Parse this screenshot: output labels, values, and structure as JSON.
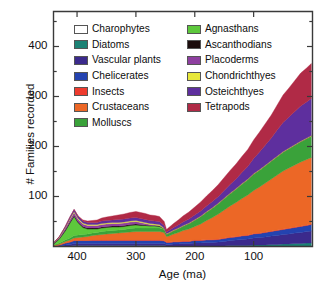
{
  "chart_data": {
    "type": "area",
    "title": "",
    "xlabel": "Age (ma)",
    "ylabel": "# Families recorded",
    "xlim": [
      440,
      0
    ],
    "ylim": [
      0,
      470
    ],
    "x_reversed": true,
    "grid": false,
    "legend_position": "upper-left-inside",
    "xticks": [
      400,
      300,
      200,
      100
    ],
    "xtick_labels": [
      "400",
      "300",
      "200",
      "100"
    ],
    "yticks": [
      100,
      200,
      300,
      400
    ],
    "ytick_labels": [
      "100",
      "200",
      "300",
      "400"
    ],
    "y_minor_ticks": [
      50,
      150,
      250,
      350,
      450
    ],
    "stacked": true,
    "x": [
      440,
      430,
      420,
      412,
      405,
      398,
      390,
      382,
      374,
      366,
      358,
      350,
      340,
      330,
      320,
      310,
      300,
      292,
      284,
      276,
      268,
      260,
      252,
      248,
      244,
      236,
      228,
      220,
      210,
      200,
      190,
      180,
      170,
      160,
      150,
      140,
      130,
      120,
      110,
      100,
      90,
      80,
      70,
      60,
      50,
      40,
      30,
      20,
      10,
      2
    ],
    "series": [
      {
        "name": "Charophytes",
        "color": "#ffffff",
        "values": [
          0,
          0,
          1,
          1,
          2,
          2,
          2,
          2,
          2,
          2,
          2,
          2,
          2,
          2,
          2,
          2,
          2,
          2,
          2,
          2,
          2,
          2,
          2,
          1,
          1,
          1,
          1,
          1,
          1,
          1,
          1,
          1,
          1,
          1,
          1,
          1,
          1,
          1,
          1,
          1,
          1,
          1,
          1,
          1,
          1,
          1,
          1,
          1,
          1,
          1
        ]
      },
      {
        "name": "Diatoms",
        "color": "#1c8275",
        "values": [
          0,
          0,
          0,
          0,
          0,
          0,
          0,
          0,
          0,
          0,
          0,
          0,
          0,
          0,
          0,
          0,
          0,
          0,
          0,
          0,
          0,
          0,
          0,
          0,
          0,
          0,
          0,
          0,
          0,
          0,
          0,
          0,
          0,
          0,
          0,
          1,
          1,
          1,
          1,
          2,
          2,
          2,
          3,
          3,
          4,
          4,
          5,
          5,
          6,
          6
        ]
      },
      {
        "name": "Vascular plants",
        "color": "#3b2a8c",
        "values": [
          0,
          1,
          2,
          3,
          4,
          4,
          4,
          4,
          4,
          4,
          4,
          4,
          4,
          4,
          4,
          4,
          4,
          4,
          4,
          4,
          4,
          4,
          4,
          3,
          3,
          4,
          4,
          5,
          5,
          6,
          6,
          7,
          7,
          8,
          9,
          10,
          11,
          12,
          13,
          14,
          15,
          16,
          17,
          18,
          19,
          20,
          21,
          22,
          23,
          24
        ]
      },
      {
        "name": "Chelicerates",
        "color": "#2443b0",
        "values": [
          1,
          2,
          4,
          5,
          6,
          6,
          6,
          6,
          6,
          6,
          6,
          6,
          6,
          6,
          6,
          6,
          6,
          6,
          6,
          6,
          6,
          6,
          5,
          4,
          4,
          4,
          4,
          4,
          4,
          5,
          5,
          5,
          5,
          5,
          6,
          6,
          6,
          7,
          7,
          8,
          8,
          9,
          9,
          10,
          10,
          11,
          11,
          12,
          12,
          13
        ]
      },
      {
        "name": "Insects",
        "color": "#ee3b2e",
        "values": [
          0,
          0,
          0,
          0,
          0,
          0,
          0,
          0,
          1,
          1,
          1,
          1,
          1,
          1,
          1,
          1,
          1,
          1,
          1,
          1,
          1,
          1,
          1,
          1,
          1,
          1,
          1,
          1,
          1,
          1,
          1,
          1,
          1,
          1,
          1,
          1,
          1,
          1,
          1,
          1,
          1,
          1,
          1,
          1,
          1,
          1,
          1,
          1,
          1,
          1
        ]
      },
      {
        "name": "Crustaceans",
        "color": "#ec6726",
        "values": [
          1,
          2,
          3,
          4,
          5,
          6,
          7,
          8,
          9,
          10,
          11,
          12,
          13,
          14,
          15,
          16,
          17,
          17,
          17,
          17,
          17,
          17,
          16,
          11,
          12,
          15,
          18,
          21,
          24,
          27,
          32,
          38,
          44,
          50,
          56,
          62,
          68,
          74,
          80,
          86,
          92,
          98,
          104,
          110,
          116,
          120,
          124,
          128,
          131,
          133
        ]
      },
      {
        "name": "Molluscs",
        "color": "#3aa23a",
        "values": [
          1,
          2,
          3,
          4,
          5,
          5,
          5,
          5,
          5,
          5,
          6,
          6,
          6,
          6,
          6,
          7,
          7,
          7,
          7,
          7,
          7,
          7,
          6,
          4,
          5,
          6,
          7,
          8,
          10,
          12,
          14,
          16,
          18,
          20,
          22,
          24,
          26,
          28,
          30,
          32,
          33,
          34,
          35,
          36,
          37,
          38,
          39,
          40,
          41,
          42
        ]
      },
      {
        "name": "Agnasthans",
        "color": "#5dc83c",
        "values": [
          2,
          8,
          18,
          30,
          38,
          24,
          14,
          10,
          8,
          7,
          7,
          7,
          7,
          6,
          6,
          6,
          6,
          5,
          5,
          4,
          4,
          3,
          2,
          1,
          1,
          1,
          1,
          1,
          1,
          1,
          1,
          1,
          1,
          1,
          1,
          1,
          1,
          1,
          1,
          1,
          1,
          1,
          1,
          1,
          1,
          1,
          1,
          1,
          1,
          1
        ]
      },
      {
        "name": "Ascanthodians",
        "color": "#1c0c0c",
        "values": [
          1,
          1,
          2,
          2,
          2,
          2,
          2,
          2,
          2,
          2,
          2,
          2,
          2,
          2,
          2,
          2,
          2,
          2,
          1,
          1,
          1,
          1,
          0,
          0,
          0,
          0,
          0,
          0,
          0,
          0,
          0,
          0,
          0,
          0,
          0,
          0,
          0,
          0,
          0,
          0,
          0,
          0,
          0,
          0,
          0,
          0,
          0,
          0,
          0,
          0
        ]
      },
      {
        "name": "Placoderms",
        "color": "#8e3fa0",
        "values": [
          1,
          2,
          4,
          5,
          6,
          5,
          5,
          5,
          5,
          5,
          5,
          5,
          5,
          5,
          5,
          5,
          5,
          4,
          3,
          2,
          1,
          1,
          0,
          0,
          0,
          0,
          0,
          0,
          0,
          0,
          0,
          0,
          0,
          0,
          0,
          0,
          0,
          0,
          0,
          0,
          0,
          0,
          0,
          0,
          0,
          0,
          0,
          0,
          0,
          0
        ]
      },
      {
        "name": "Chondrichthyes",
        "color": "#e8e83a",
        "values": [
          0,
          1,
          1,
          2,
          2,
          2,
          2,
          2,
          2,
          2,
          2,
          2,
          2,
          2,
          2,
          2,
          2,
          2,
          2,
          2,
          2,
          2,
          1,
          1,
          1,
          1,
          1,
          1,
          1,
          1,
          1,
          1,
          1,
          1,
          1,
          1,
          1,
          1,
          1,
          1,
          1,
          1,
          1,
          1,
          1,
          1,
          1,
          1,
          1,
          1
        ]
      },
      {
        "name": "Osteichthyes",
        "color": "#5e2f9e",
        "values": [
          0,
          1,
          2,
          3,
          4,
          4,
          4,
          4,
          4,
          4,
          5,
          5,
          5,
          6,
          6,
          6,
          6,
          6,
          6,
          6,
          6,
          6,
          5,
          3,
          4,
          5,
          6,
          7,
          8,
          9,
          10,
          11,
          12,
          13,
          15,
          17,
          19,
          22,
          25,
          30,
          35,
          40,
          45,
          52,
          58,
          62,
          66,
          70,
          72,
          74
        ]
      },
      {
        "name": "Tetrapods",
        "color": "#b02a46",
        "values": [
          0,
          0,
          0,
          0,
          0,
          1,
          2,
          3,
          4,
          5,
          6,
          7,
          8,
          9,
          10,
          11,
          12,
          12,
          12,
          11,
          11,
          10,
          8,
          5,
          6,
          8,
          10,
          12,
          14,
          16,
          18,
          20,
          22,
          24,
          26,
          28,
          30,
          32,
          34,
          37,
          40,
          43,
          46,
          50,
          55,
          58,
          62,
          66,
          68,
          70
        ]
      }
    ]
  },
  "legend": {
    "columns": [
      {
        "items": [
          {
            "label": "Charophytes",
            "color": "#ffffff"
          },
          {
            "label": "Diatoms",
            "color": "#1c8275"
          },
          {
            "label": "Vascular plants",
            "color": "#3b2a8c"
          },
          {
            "label": "Chelicerates",
            "color": "#2443b0"
          },
          {
            "label": "Insects",
            "color": "#ee3b2e"
          },
          {
            "label": "Crustaceans",
            "color": "#ec6726"
          },
          {
            "label": "Molluscs",
            "color": "#3aa23a"
          }
        ]
      },
      {
        "items": [
          {
            "label": "Agnasthans",
            "color": "#5dc83c"
          },
          {
            "label": "Ascanthodians",
            "color": "#1c0c0c"
          },
          {
            "label": "Placoderms",
            "color": "#8e3fa0"
          },
          {
            "label": "Chondrichthyes",
            "color": "#e8e83a"
          },
          {
            "label": "Osteichthyes",
            "color": "#5e2f9e"
          },
          {
            "label": "Tetrapods",
            "color": "#b02a46"
          }
        ]
      }
    ]
  },
  "axes": {
    "x_title": "Age (ma)",
    "y_title": "# Families recorded"
  }
}
